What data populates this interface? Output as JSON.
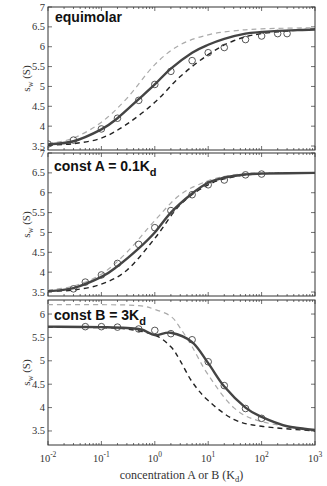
{
  "chart_data": [
    {
      "type": "line",
      "title": "equimolar",
      "xlabel": "concentration A or B (K_d)",
      "ylabel": "s_w (S)",
      "xscale": "log",
      "xlim": [
        0.01,
        1000
      ],
      "ylim": [
        3.4,
        7
      ],
      "yticks": [
        "3.5",
        "4",
        "4.5",
        "5",
        "5.5",
        "6",
        "6.5",
        "7"
      ],
      "series": [
        {
          "name": "fit (solid dark)",
          "style": "solid",
          "x": [
            0.01,
            0.03,
            0.1,
            0.2,
            0.5,
            1,
            2,
            5,
            10,
            20,
            50,
            100,
            200,
            500,
            1000
          ],
          "values": [
            3.54,
            3.62,
            3.92,
            4.2,
            4.68,
            5.05,
            5.45,
            5.85,
            6.05,
            6.2,
            6.33,
            6.37,
            6.4,
            6.42,
            6.43
          ]
        },
        {
          "name": "data points",
          "style": "marker-circle",
          "x": [
            0.01,
            0.03,
            0.1,
            0.2,
            0.5,
            1,
            2,
            5,
            10,
            20,
            50,
            100,
            200,
            300
          ],
          "values": [
            3.55,
            3.65,
            3.93,
            4.2,
            4.65,
            5.05,
            5.38,
            5.65,
            5.85,
            5.98,
            6.18,
            6.27,
            6.33,
            6.33
          ]
        },
        {
          "name": "light dashed",
          "style": "dashed-light",
          "x": [
            0.01,
            0.03,
            0.1,
            0.3,
            1,
            3,
            10,
            30,
            100,
            1000
          ],
          "values": [
            3.56,
            3.7,
            4.1,
            4.7,
            5.55,
            6.05,
            6.3,
            6.4,
            6.45,
            6.48
          ]
        },
        {
          "name": "dark dashed",
          "style": "dashed-dark",
          "x": [
            0.01,
            0.03,
            0.1,
            0.3,
            1,
            3,
            10,
            30,
            100,
            1000
          ],
          "values": [
            3.52,
            3.56,
            3.7,
            4.05,
            4.6,
            5.25,
            5.8,
            6.15,
            6.33,
            6.45
          ]
        }
      ]
    },
    {
      "type": "line",
      "title": "const A = 0.1K_d",
      "ylabel": "s_w (S)",
      "xscale": "log",
      "xlim": [
        0.01,
        1000
      ],
      "ylim": [
        3.4,
        7
      ],
      "yticks": [
        "3.5",
        "4",
        "4.5",
        "5",
        "5.5",
        "6",
        "6.5",
        "7"
      ],
      "series": [
        {
          "name": "fit (solid dark)",
          "style": "solid",
          "x": [
            0.01,
            0.03,
            0.1,
            0.2,
            0.5,
            1,
            2,
            5,
            10,
            20,
            50,
            100,
            1000
          ],
          "values": [
            3.52,
            3.6,
            3.88,
            4.15,
            4.6,
            5.0,
            5.5,
            5.98,
            6.25,
            6.38,
            6.46,
            6.48,
            6.5
          ]
        },
        {
          "name": "data points",
          "style": "marker-circle",
          "x": [
            0.03,
            0.05,
            0.1,
            0.2,
            0.5,
            1,
            2,
            5,
            10,
            20,
            50,
            100
          ],
          "values": [
            3.58,
            3.75,
            3.93,
            4.22,
            4.7,
            5.12,
            5.55,
            5.95,
            6.2,
            6.32,
            6.45,
            6.47
          ]
        },
        {
          "name": "light dashed",
          "style": "dashed-light",
          "x": [
            0.01,
            0.03,
            0.1,
            0.3,
            1,
            3,
            10,
            30,
            100,
            1000
          ],
          "values": [
            3.55,
            3.65,
            3.95,
            4.5,
            5.3,
            5.95,
            6.3,
            6.45,
            6.5,
            6.5
          ]
        },
        {
          "name": "dark dashed",
          "style": "dashed-dark",
          "x": [
            0.01,
            0.03,
            0.1,
            0.3,
            1,
            3,
            10,
            30,
            100,
            1000
          ],
          "values": [
            3.52,
            3.55,
            3.7,
            4.05,
            4.85,
            5.7,
            6.2,
            6.4,
            6.48,
            6.5
          ]
        }
      ]
    },
    {
      "type": "line",
      "title": "const B = 3K_d",
      "ylabel": "s_w (S)",
      "xlabel": "concentration A or B (K_d)",
      "xscale": "log",
      "xlim": [
        0.01,
        1000
      ],
      "ylim": [
        3.2,
        6.3
      ],
      "yticks": [
        "3.5",
        "4",
        "4.5",
        "5",
        "5.5",
        "6"
      ],
      "xticks": [
        "10^-2",
        "10^-1",
        "10^0",
        "10^1",
        "10^2",
        "10^3"
      ],
      "series": [
        {
          "name": "fit (solid dark)",
          "style": "solid",
          "x": [
            0.01,
            0.1,
            0.5,
            1,
            2,
            5,
            10,
            20,
            50,
            100,
            300,
            1000
          ],
          "values": [
            5.73,
            5.72,
            5.68,
            5.55,
            5.6,
            5.4,
            4.95,
            4.45,
            4.0,
            3.8,
            3.6,
            3.52
          ]
        },
        {
          "name": "data points",
          "style": "marker-circle",
          "x": [
            0.05,
            0.1,
            0.2,
            0.5,
            1,
            2,
            5,
            10,
            20,
            50,
            100
          ],
          "values": [
            5.73,
            5.73,
            5.72,
            5.68,
            5.65,
            5.58,
            5.45,
            4.98,
            4.47,
            3.98,
            3.77
          ]
        },
        {
          "name": "light dashed",
          "style": "dashed-light",
          "x": [
            0.01,
            0.1,
            0.5,
            1,
            2,
            3,
            5,
            10,
            30,
            100,
            1000
          ],
          "values": [
            6.2,
            6.2,
            6.18,
            6.1,
            5.95,
            5.7,
            5.3,
            4.7,
            4.0,
            3.7,
            3.52
          ]
        },
        {
          "name": "dark dashed",
          "style": "dashed-dark",
          "x": [
            0.01,
            0.1,
            0.3,
            1,
            2,
            3,
            5,
            10,
            30,
            100,
            1000
          ],
          "values": [
            5.72,
            5.71,
            5.68,
            5.55,
            5.3,
            5.0,
            4.55,
            4.15,
            3.75,
            3.6,
            3.5
          ]
        }
      ]
    }
  ],
  "labels": {
    "panel1_title": "equimolar",
    "panel2_title_main": "const A = 0.1K",
    "panel2_title_sub": "d",
    "panel3_title_main": "const B = 3K",
    "panel3_title_sub": "d",
    "ylabel_main": "s",
    "ylabel_sub": "w",
    "ylabel_unit": " (S)",
    "xlabel_main": "concentration A or B (K",
    "xlabel_sub": "d",
    "xlabel_end": ")"
  },
  "colors": {
    "solid": "#444444",
    "dark_dashed": "#222222",
    "light_dashed": "#aaaaaa",
    "marker": "#444444"
  }
}
